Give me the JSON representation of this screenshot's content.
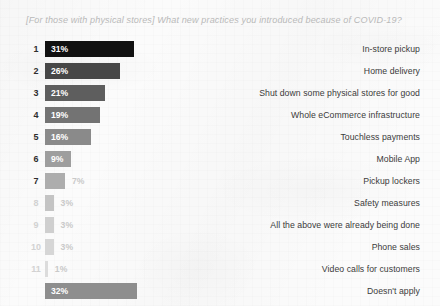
{
  "chart_data": {
    "type": "bar",
    "title": "[For those with physical stores] What new practices you introduced because of COVID-19?",
    "xlabel": "",
    "ylabel": "",
    "orientation": "horizontal",
    "grid": false,
    "legend": false,
    "value_suffix": "%",
    "xlim": [
      0,
      35
    ],
    "categories": [
      "In-store pickup",
      "Home delivery",
      "Shut down some physical stores for good",
      "Whole eCommerce infrastructure",
      "Touchless payments",
      "Mobile App",
      "Pickup lockers",
      "Safety measures",
      "All the above were already being done",
      "Phone sales",
      "Video calls for customers",
      "Doesn't apply"
    ],
    "values": [
      31,
      26,
      21,
      19,
      16,
      9,
      7,
      3,
      3,
      3,
      1,
      32
    ],
    "value_labels": [
      "31%",
      "26%",
      "21%",
      "19%",
      "16%",
      "9%",
      "7%",
      "3%",
      "3%",
      "3%",
      "1%",
      "32%"
    ],
    "ranks": [
      "1",
      "2",
      "3",
      "4",
      "5",
      "6",
      "7",
      "8",
      "9",
      "10",
      "11",
      ""
    ],
    "bar_colors": [
      "#111111",
      "#474747",
      "#5e5e5e",
      "#737373",
      "#8a8a8a",
      "#9e9e9e",
      "#adadad",
      "#c4c4c4",
      "#cfcfcf",
      "#d6d6d6",
      "#dcdcdc",
      "#8e8e8e"
    ],
    "label_inside": [
      true,
      true,
      true,
      true,
      true,
      true,
      false,
      false,
      false,
      false,
      false,
      true
    ]
  },
  "rows": [
    {
      "rank": "1",
      "value_label": "31%",
      "category": "In-store pickup"
    },
    {
      "rank": "2",
      "value_label": "26%",
      "category": "Home delivery"
    },
    {
      "rank": "3",
      "value_label": "21%",
      "category": "Shut down some physical stores for good"
    },
    {
      "rank": "4",
      "value_label": "19%",
      "category": "Whole eCommerce infrastructure"
    },
    {
      "rank": "5",
      "value_label": "16%",
      "category": "Touchless payments"
    },
    {
      "rank": "6",
      "value_label": "9%",
      "category": "Mobile App"
    },
    {
      "rank": "7",
      "value_label": "7%",
      "category": "Pickup lockers"
    },
    {
      "rank": "8",
      "value_label": "3%",
      "category": "Safety measures"
    },
    {
      "rank": "9",
      "value_label": "3%",
      "category": "All the above were already being done"
    },
    {
      "rank": "10",
      "value_label": "3%",
      "category": "Phone sales"
    },
    {
      "rank": "11",
      "value_label": "1%",
      "category": "Video calls for customers"
    },
    {
      "rank": "",
      "value_label": "32%",
      "category": "Doesn't apply"
    }
  ]
}
